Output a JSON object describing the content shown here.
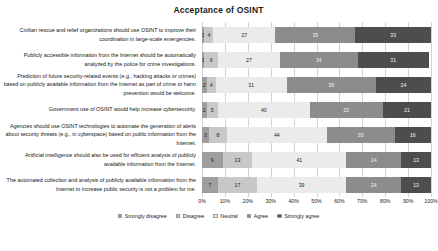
{
  "chart_data": {
    "type": "bar",
    "subtype": "100% stacked horizontal bar (Likert)",
    "title": "Acceptance of OSINT",
    "xlabel": "",
    "ylabel": "",
    "xlim": [
      0,
      100
    ],
    "grid": true,
    "legend_position": "bottom",
    "xticks": [
      "0%",
      "10%",
      "20%",
      "30%",
      "40%",
      "50%",
      "60%",
      "70%",
      "80%",
      "90%",
      "100%"
    ],
    "series": [
      {
        "name": "Strongly disagree",
        "color": "#9e9e9e",
        "values": [
          1,
          1,
          2,
          2,
          3,
          9,
          7
        ]
      },
      {
        "name": "Disagree",
        "color": "#c8c8c8",
        "values": [
          4,
          6,
          4,
          5,
          8,
          13,
          17
        ]
      },
      {
        "name": "Neutral",
        "color": "#ebebeb",
        "values": [
          27,
          27,
          31,
          40,
          44,
          41,
          39
        ]
      },
      {
        "name": "Agree",
        "color": "#8c8c8c",
        "values": [
          35,
          34,
          39,
          32,
          30,
          24,
          24
        ]
      },
      {
        "name": "Strongly agree",
        "color": "#4d4d4d",
        "values": [
          33,
          31,
          24,
          21,
          16,
          13,
          13
        ]
      }
    ],
    "categories": [
      "Civilian rescue and relief organizations should use OSINT to improve their coordination in large-scale emergencies.",
      "Publicly accessible information from the Internet should be automatically analyzed by the police for crime investigations.",
      "Prediction of future security-related events (e.g., hacking attacks or crimes) based on publicly available information from the Internet as part of crime or harm prevention would be welcome.",
      "Government use of OSINT would help increase cybersecurity.",
      "Agencies should use OSINT technologies to automate the generation of alerts about security threats (e.g., in cyberspace) based on public information from the Internet.",
      "Artificial intelligence should also be used for efficient analysis of publicly available information from the Internet.",
      "The automated collection and analysis of publicly available information from the Internet to increase public security is not a problem for me."
    ]
  }
}
